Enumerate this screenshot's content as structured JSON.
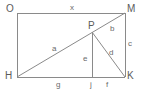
{
  "figure": {
    "kind": "geometry-diagram",
    "stroke_color": "#8a8a8a",
    "label_color": "#5b5b5b",
    "background_color": "#ffffff"
  },
  "vertices": [
    {
      "id": "O",
      "label": "O",
      "x": 17,
      "y": 13,
      "label_x": 6,
      "label_y": 4
    },
    {
      "id": "M",
      "label": "M",
      "x": 125,
      "y": 13,
      "label_x": 127,
      "label_y": 4
    },
    {
      "id": "K",
      "label": "K",
      "x": 125,
      "y": 77,
      "label_x": 127,
      "label_y": 71
    },
    {
      "id": "H",
      "label": "H",
      "x": 17,
      "y": 77,
      "label_x": 5,
      "label_y": 71
    },
    {
      "id": "P",
      "label": "P",
      "x": 92,
      "y": 32,
      "label_x": 88,
      "label_y": 21
    },
    {
      "id": "J",
      "label": "j",
      "x": 92,
      "y": 77,
      "label_x": 90,
      "label_y": 81
    }
  ],
  "segments": [
    {
      "id": "OM",
      "from": "O",
      "to": "M",
      "label": "x",
      "label_x": 70,
      "label_y": 4
    },
    {
      "id": "MK",
      "from": "M",
      "to": "K",
      "label": "c",
      "label_x": 128,
      "label_y": 40
    },
    {
      "id": "HK",
      "from": "H",
      "to": "K",
      "label": "",
      "label_x": 0,
      "label_y": 0
    },
    {
      "id": "OH",
      "from": "O",
      "to": "H",
      "label": "",
      "label_x": 0,
      "label_y": 0
    },
    {
      "id": "HP",
      "from": "H",
      "to": "P",
      "label": "a",
      "label_x": 52,
      "label_y": 45
    },
    {
      "id": "PM",
      "from": "P",
      "to": "M",
      "label": "b",
      "label_x": 110,
      "label_y": 25
    },
    {
      "id": "PK",
      "from": "P",
      "to": "K",
      "label": "d",
      "label_x": 109,
      "label_y": 49
    },
    {
      "id": "PJ",
      "from": "P",
      "to": "J",
      "label": "e",
      "label_x": 83,
      "label_y": 55
    },
    {
      "id": "HJ",
      "from": "H",
      "to": "J",
      "label": "g",
      "label_x": 56,
      "label_y": 81
    },
    {
      "id": "JK",
      "from": "J",
      "to": "K",
      "label": "f",
      "label_x": 106,
      "label_y": 81
    }
  ],
  "labels": {
    "x": "x",
    "a": "a",
    "b": "b",
    "c": "c",
    "d": "d",
    "e": "e",
    "f": "f",
    "g": "g",
    "j": "j",
    "O": "O",
    "M": "M",
    "H": "H",
    "K": "K",
    "P": "P"
  }
}
